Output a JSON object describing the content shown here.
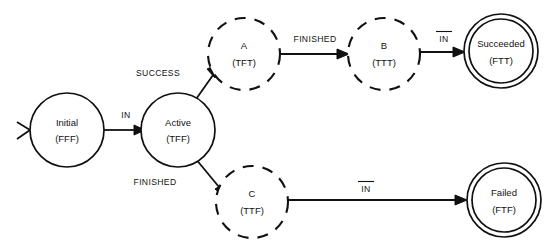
{
  "diagram": {
    "colors": {
      "stroke": "#111111",
      "background": "#ffffff"
    },
    "nodes": [
      {
        "id": "initial",
        "label": "Initial",
        "code": "(FFF)",
        "shape": "circle-solid",
        "cx": 67,
        "cy": 130,
        "r": 37
      },
      {
        "id": "active",
        "label": "Active",
        "code": "(TFF)",
        "shape": "circle-solid",
        "cx": 178,
        "cy": 130,
        "r": 37
      },
      {
        "id": "a",
        "label": "A",
        "code": "(TFT)",
        "shape": "circle-dashed",
        "cx": 244,
        "cy": 54,
        "r": 36
      },
      {
        "id": "b",
        "label": "B",
        "code": "(TTT)",
        "shape": "circle-dashed",
        "cx": 384,
        "cy": 54,
        "r": 36
      },
      {
        "id": "c",
        "label": "C",
        "code": "(TTF)",
        "shape": "circle-dashed",
        "cx": 252,
        "cy": 202,
        "r": 36
      },
      {
        "id": "succeeded",
        "label": "Succeeded",
        "code": "(FTT)",
        "shape": "circle-double",
        "cx": 501,
        "cy": 51,
        "r": 37,
        "r_inner": 32
      },
      {
        "id": "failed",
        "label": "Failed",
        "code": "(FTF)",
        "shape": "circle-double",
        "cx": 504,
        "cy": 200,
        "r": 37,
        "r_inner": 32
      }
    ],
    "edges": [
      {
        "id": "start-initial",
        "from": "",
        "to": "initial",
        "label": "",
        "overline": false
      },
      {
        "id": "initial-active",
        "from": "initial",
        "to": "active",
        "label": "IN",
        "overline": false
      },
      {
        "id": "active-a",
        "from": "active",
        "to": "a",
        "label": "SUCCESS",
        "overline": false
      },
      {
        "id": "a-b",
        "from": "a",
        "to": "b",
        "label": "FINISHED",
        "overline": false
      },
      {
        "id": "b-succeeded",
        "from": "b",
        "to": "succeeded",
        "label": "IN",
        "overline": true
      },
      {
        "id": "active-c",
        "from": "active",
        "to": "c",
        "label": "FINISHED",
        "overline": false
      },
      {
        "id": "c-failed",
        "from": "c",
        "to": "failed",
        "label": "IN",
        "overline": true
      }
    ]
  }
}
